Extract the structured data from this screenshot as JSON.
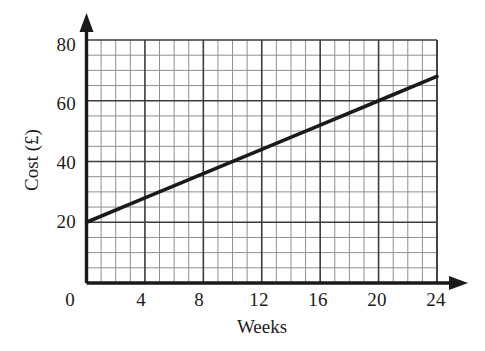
{
  "chart_data": {
    "type": "line",
    "title": "",
    "subtitle": "",
    "xlabel": "Weeks",
    "ylabel": "Cost (£)",
    "xlim": [
      0,
      24
    ],
    "ylim": [
      0,
      80
    ],
    "xticks": [
      "0",
      "4",
      "8",
      "12",
      "16",
      "20",
      "24"
    ],
    "xtick_values": [
      0,
      4,
      8,
      12,
      16,
      20,
      24
    ],
    "yticks": [
      "20",
      "40",
      "60",
      "80"
    ],
    "ytick_values": [
      20,
      40,
      60,
      80
    ],
    "grid": true,
    "grid_minor": true,
    "grid_minor_per_major_x": 4,
    "grid_minor_per_major_y": 4,
    "legend": null,
    "legend_position": "none",
    "annotations": [],
    "series": [
      {
        "name": "Cost",
        "x": [
          0,
          4,
          8,
          12,
          16,
          20,
          24
        ],
        "values": [
          20,
          28,
          36,
          44,
          52,
          60,
          68
        ],
        "color": "#1a1a1a",
        "line_width": 3.6,
        "equation": "Cost = 20 + 2 × Weeks"
      }
    ],
    "colors": {
      "line": "#1a1a1a",
      "axis": "#1a1a1a",
      "grid_major": "#3a3a3a",
      "grid_minor": "#8a8a8a",
      "background": "#ffffff",
      "text": "#1c1c1c"
    }
  },
  "axes": {
    "x_axis_name": "weeks-axis",
    "y_axis_name": "cost-axis",
    "x_arrow": true,
    "y_arrow": true
  }
}
